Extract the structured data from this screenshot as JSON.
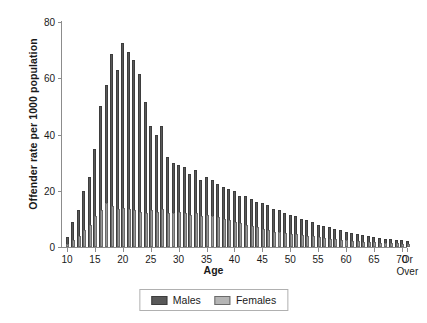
{
  "chart_data": {
    "type": "bar",
    "title": "",
    "xlabel": "Age",
    "ylabel": "Offender rate per 1000 population",
    "ylim": [
      0,
      80
    ],
    "yticks": [
      0,
      20,
      40,
      60,
      80
    ],
    "xticks": [
      10,
      15,
      20,
      25,
      30,
      35,
      40,
      45,
      50,
      55,
      60,
      65,
      70
    ],
    "xtick_last_label": "Or Over",
    "grid": false,
    "legend_position": "bottom",
    "categories": [
      10,
      11,
      12,
      13,
      14,
      15,
      16,
      17,
      18,
      19,
      20,
      21,
      22,
      23,
      24,
      25,
      26,
      27,
      28,
      29,
      30,
      31,
      32,
      33,
      34,
      35,
      36,
      37,
      38,
      39,
      40,
      41,
      42,
      43,
      44,
      45,
      46,
      47,
      48,
      49,
      50,
      51,
      52,
      53,
      54,
      55,
      56,
      57,
      58,
      59,
      60,
      61,
      62,
      63,
      64,
      65,
      66,
      67,
      68,
      69,
      70,
      71
    ],
    "series": [
      {
        "name": "Males",
        "color": "#595959",
        "values": [
          3.5,
          9,
          13,
          20,
          25,
          35,
          50,
          57.5,
          68.5,
          63,
          72.5,
          69.5,
          66.5,
          61.5,
          51.5,
          43,
          40,
          43,
          32,
          30,
          29,
          28.5,
          26,
          27.5,
          24,
          25,
          24,
          22.5,
          21.5,
          20.5,
          20,
          18,
          18,
          17,
          16,
          15.5,
          15,
          13.5,
          13,
          12,
          11.5,
          11,
          10,
          9.5,
          9,
          8,
          7.5,
          7,
          6.5,
          6,
          5.5,
          5,
          4.5,
          4.2,
          4,
          3.5,
          3.3,
          3,
          2.8,
          2.6,
          2.4,
          2.2
        ]
      },
      {
        "name": "Females",
        "color": "#9a9a9a",
        "values": [
          1,
          2.5,
          4,
          6,
          8,
          11,
          13,
          15.5,
          14.5,
          13.5,
          14,
          13.5,
          13,
          12.5,
          12,
          13,
          12.5,
          13.5,
          12,
          12,
          12.5,
          12,
          11.5,
          12,
          11,
          11.5,
          11,
          10.5,
          10,
          9.5,
          9,
          8.5,
          8,
          7.5,
          7,
          6.5,
          6,
          5.5,
          5.2,
          5,
          4.8,
          4.5,
          4.2,
          4,
          3.8,
          3.5,
          3.3,
          3,
          2.8,
          2.6,
          2.4,
          2.2,
          2,
          1.9,
          1.8,
          1.7,
          1.6,
          1.5,
          1.4,
          1.3,
          1.2,
          1.1
        ]
      }
    ]
  },
  "legend": {
    "items": [
      {
        "label": "Males"
      },
      {
        "label": "Females"
      }
    ]
  }
}
